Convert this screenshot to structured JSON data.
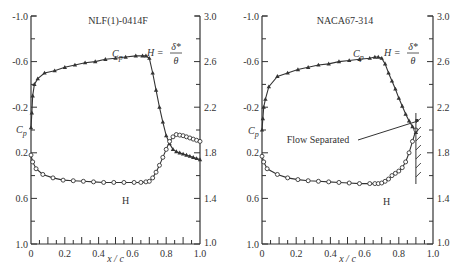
{
  "chart_data": [
    {
      "type": "line",
      "title": "NLF(1)-0414F",
      "xlabel": "x / c",
      "ylabel_left": "C_p",
      "ylabel_right": "H = δ*/θ",
      "xlim": [
        0,
        1.0
      ],
      "ylim_left": [
        -1.0,
        1.0
      ],
      "ylim_right": [
        1.0,
        3.0
      ],
      "x_ticks": [
        "0",
        "0.2",
        "0.4",
        "0.6",
        "0.8",
        "1.0"
      ],
      "y_ticks_left": [
        "-1.0",
        "-0.6",
        "-0.2",
        "0.2",
        "0.6",
        "1.0"
      ],
      "y_ticks_right": [
        "3.0",
        "2.6",
        "2.2",
        "1.8",
        "1.4",
        "1.0"
      ],
      "annotations": [
        "C_p",
        "H = δ*/θ",
        "H"
      ],
      "grid": false,
      "series": [
        {
          "name": "C_p",
          "marker": "triangle",
          "axis": "left",
          "x": [
            0.0,
            0.005,
            0.01,
            0.02,
            0.04,
            0.08,
            0.14,
            0.2,
            0.26,
            0.32,
            0.38,
            0.44,
            0.5,
            0.56,
            0.62,
            0.66,
            0.68,
            0.7,
            0.72,
            0.74,
            0.76,
            0.78,
            0.8,
            0.82,
            0.84,
            0.86,
            0.88,
            0.9,
            0.92,
            0.94,
            0.96,
            0.98,
            1.0
          ],
          "values": [
            -0.02,
            -0.15,
            -0.3,
            -0.4,
            -0.45,
            -0.5,
            -0.52,
            -0.55,
            -0.57,
            -0.59,
            -0.6,
            -0.62,
            -0.63,
            -0.64,
            -0.65,
            -0.65,
            -0.65,
            -0.63,
            -0.5,
            -0.35,
            -0.2,
            -0.07,
            0.05,
            0.12,
            0.17,
            0.19,
            0.2,
            0.21,
            0.22,
            0.23,
            0.24,
            0.25,
            0.26
          ]
        },
        {
          "name": "H",
          "marker": "circle",
          "axis": "right",
          "x": [
            0.0,
            0.01,
            0.03,
            0.07,
            0.13,
            0.19,
            0.25,
            0.31,
            0.37,
            0.43,
            0.49,
            0.55,
            0.61,
            0.65,
            0.68,
            0.7,
            0.72,
            0.74,
            0.76,
            0.78,
            0.8,
            0.82,
            0.84,
            0.86,
            0.88,
            0.9,
            0.92,
            0.94,
            0.96,
            0.98,
            1.0
          ],
          "values": [
            1.78,
            1.72,
            1.66,
            1.61,
            1.58,
            1.56,
            1.555,
            1.55,
            1.545,
            1.54,
            1.54,
            1.54,
            1.54,
            1.54,
            1.545,
            1.55,
            1.58,
            1.63,
            1.69,
            1.76,
            1.83,
            1.9,
            1.94,
            1.96,
            1.955,
            1.95,
            1.94,
            1.93,
            1.92,
            1.91,
            1.9
          ]
        }
      ]
    },
    {
      "type": "line",
      "title": "NACA67-314",
      "xlabel": "x / c",
      "ylabel_left": "C_p",
      "ylabel_right": "H = δ*/θ",
      "xlim": [
        0,
        1.0
      ],
      "ylim_left": [
        -1.0,
        1.0
      ],
      "ylim_right": [
        1.0,
        3.0
      ],
      "x_ticks": [
        "0",
        "0.2",
        "0.4",
        "0.6",
        "0.8",
        "1.0"
      ],
      "y_ticks_left": [
        "-1.0",
        "-0.6",
        "-0.2",
        "0.2",
        "0.6",
        "1.0"
      ],
      "y_ticks_right": [
        "3.0",
        "2.6",
        "2.2",
        "1.8",
        "1.4",
        "1.0"
      ],
      "annotations": [
        "C_p",
        "H = δ*/θ",
        "H",
        "Flow Separated"
      ],
      "grid": false,
      "separation_x": 0.9,
      "series": [
        {
          "name": "C_p",
          "marker": "triangle",
          "axis": "left",
          "x": [
            0.0,
            0.005,
            0.01,
            0.02,
            0.04,
            0.09,
            0.15,
            0.21,
            0.27,
            0.33,
            0.39,
            0.45,
            0.51,
            0.57,
            0.63,
            0.66,
            0.68,
            0.7,
            0.72,
            0.74,
            0.76,
            0.78,
            0.8,
            0.82,
            0.84,
            0.86,
            0.88,
            0.9
          ],
          "values": [
            0.0,
            -0.1,
            -0.2,
            -0.27,
            -0.38,
            -0.47,
            -0.5,
            -0.53,
            -0.55,
            -0.57,
            -0.58,
            -0.6,
            -0.61,
            -0.62,
            -0.63,
            -0.64,
            -0.64,
            -0.63,
            -0.58,
            -0.5,
            -0.43,
            -0.36,
            -0.28,
            -0.21,
            -0.14,
            -0.08,
            -0.03,
            0.02
          ]
        },
        {
          "name": "H",
          "marker": "circle",
          "axis": "right",
          "x": [
            0.0,
            0.01,
            0.03,
            0.09,
            0.15,
            0.21,
            0.27,
            0.33,
            0.39,
            0.45,
            0.51,
            0.57,
            0.63,
            0.66,
            0.68,
            0.7,
            0.72,
            0.74,
            0.76,
            0.78,
            0.8,
            0.82,
            0.84,
            0.86,
            0.88,
            0.9
          ],
          "values": [
            1.77,
            1.72,
            1.66,
            1.61,
            1.58,
            1.565,
            1.555,
            1.55,
            1.545,
            1.54,
            1.535,
            1.53,
            1.53,
            1.53,
            1.53,
            1.535,
            1.55,
            1.57,
            1.6,
            1.62,
            1.64,
            1.67,
            1.72,
            1.8,
            1.9,
            2.0
          ]
        }
      ]
    }
  ]
}
